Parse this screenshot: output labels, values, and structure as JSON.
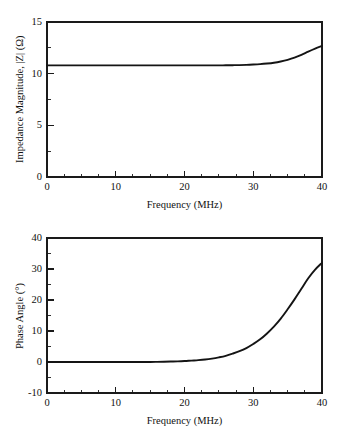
{
  "chart_data": [
    {
      "type": "line",
      "id": "impedance-magnitude",
      "title": "",
      "xlabel": "Frequency (MHz)",
      "ylabel": "Impedance Magnitude, |Z| (Ω)",
      "xlim": [
        0,
        40
      ],
      "ylim": [
        0,
        15
      ],
      "xticks": [
        0,
        10,
        20,
        30,
        40
      ],
      "xtick_labels": [
        "0",
        "10",
        "20",
        "30",
        "40"
      ],
      "yticks": [
        0,
        5,
        10,
        15
      ],
      "ytick_labels": [
        "0",
        "5",
        "10",
        "15"
      ],
      "x_minor_step": 2.5,
      "y_minor_step": 2.5,
      "grid": false,
      "legend": null,
      "series": [
        {
          "name": "Impedance magnitude",
          "color": "#141414",
          "x": [
            0,
            1,
            2,
            3,
            4,
            5,
            6,
            7,
            8,
            9,
            10,
            11,
            12,
            13,
            14,
            15,
            16,
            17,
            18,
            19,
            20,
            21,
            22,
            23,
            24,
            25,
            26,
            27,
            28,
            29,
            30,
            31,
            32,
            33,
            34,
            35,
            36,
            37,
            38,
            39,
            40
          ],
          "values": [
            10.8,
            10.8,
            10.8,
            10.8,
            10.8,
            10.8,
            10.8,
            10.8,
            10.8,
            10.8,
            10.8,
            10.8,
            10.8,
            10.8,
            10.8,
            10.8,
            10.8,
            10.8,
            10.8,
            10.8,
            10.8,
            10.8,
            10.8,
            10.8,
            10.8,
            10.8,
            10.81,
            10.82,
            10.83,
            10.85,
            10.88,
            10.92,
            10.98,
            11.06,
            11.18,
            11.34,
            11.55,
            11.82,
            12.13,
            12.42,
            12.68
          ]
        }
      ]
    },
    {
      "type": "line",
      "id": "phase-angle",
      "title": "",
      "xlabel": "Frequency (MHz)",
      "ylabel": "Phase Angle (°)",
      "xlim": [
        0,
        40
      ],
      "ylim": [
        -10,
        40
      ],
      "xticks": [
        0,
        10,
        20,
        30,
        40
      ],
      "xtick_labels": [
        "0",
        "10",
        "20",
        "30",
        "40"
      ],
      "yticks": [
        -10,
        0,
        10,
        20,
        30,
        40
      ],
      "ytick_labels": [
        "-10",
        "0",
        "10",
        "20",
        "30",
        "40"
      ],
      "x_minor_step": 2.5,
      "y_minor_step": 5,
      "grid": false,
      "legend": null,
      "series": [
        {
          "name": "Phase angle",
          "color": "#141414",
          "x": [
            0,
            1,
            2,
            3,
            4,
            5,
            6,
            7,
            8,
            9,
            10,
            11,
            12,
            13,
            14,
            15,
            16,
            17,
            18,
            19,
            20,
            21,
            22,
            23,
            24,
            25,
            26,
            27,
            28,
            29,
            30,
            31,
            32,
            33,
            34,
            35,
            36,
            37,
            38,
            39,
            40
          ],
          "values": [
            0.0,
            0.0,
            0.0,
            0.0,
            0.0,
            0.0,
            0.0,
            0.0,
            0.0,
            0.0,
            0.0,
            0.0,
            0.0,
            0.0,
            0.0,
            0.0,
            0.05,
            0.1,
            0.15,
            0.2,
            0.3,
            0.45,
            0.6,
            0.8,
            1.1,
            1.5,
            2.0,
            2.7,
            3.5,
            4.5,
            5.8,
            7.3,
            9.2,
            11.4,
            14.0,
            17.0,
            20.2,
            23.6,
            27.0,
            29.8,
            32.0
          ]
        }
      ]
    }
  ]
}
